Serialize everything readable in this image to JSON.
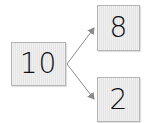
{
  "diagram": {
    "type": "number-bond-tree",
    "root": {
      "value": "10"
    },
    "children": [
      {
        "value": "8"
      },
      {
        "value": "2"
      }
    ],
    "colors": {
      "box_fill": "#e9e9e9",
      "box_border": "#b4b4b4",
      "arrow": "#8a8a8a",
      "text": "#111111"
    }
  }
}
